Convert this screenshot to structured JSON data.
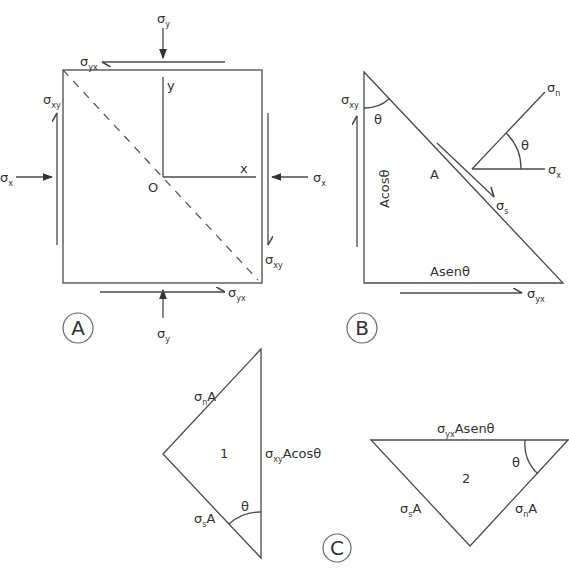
{
  "panelA": {
    "label": "A",
    "sigma": "σ",
    "sub_y": "y",
    "sub_x": "x",
    "sub_xy": "xy",
    "sub_yx": "yx",
    "axis_y": "y",
    "axis_x": "x",
    "origin": "O"
  },
  "panelB": {
    "label": "B",
    "sigma": "σ",
    "sub_xy": "xy",
    "sub_yx": "yx",
    "sub_s": "s",
    "sub_n": "n",
    "sub_x": "x",
    "theta": "θ",
    "area": "A",
    "acos": "Acosθ",
    "asen": "Asenθ"
  },
  "panelC": {
    "label": "C",
    "sigma": "σ",
    "tri1_number": "1",
    "tri2_number": "2",
    "sub_n": "n",
    "sub_s": "s",
    "sub_xy": "xy",
    "sub_yx": "yx",
    "A": "A",
    "acos": "Acosθ",
    "asen": "Asenθ",
    "theta": "θ"
  }
}
